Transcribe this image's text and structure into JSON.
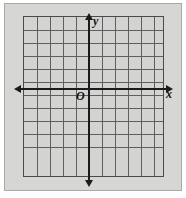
{
  "figure": {
    "kind": "coordinate-plane",
    "caption": "",
    "background_color": "#d6d6d4",
    "plate_color": "#d3d3d1",
    "grid_line_color": "#5f5f5f",
    "axis_color": "#1b1b1b",
    "frame_color": "#a8a8a6"
  },
  "labels": {
    "y_axis": "y",
    "x_axis": "x",
    "origin": "O"
  },
  "chart_data": {
    "type": "scatter",
    "title": "",
    "xlabel": "x",
    "ylabel": "y",
    "origin_label": "O",
    "grid": true,
    "legend": "none",
    "columns": 11,
    "rows": 11,
    "cell_size": 13,
    "xlim": [
      -6,
      5
    ],
    "ylim": [
      -6,
      5
    ],
    "x_tick_step": 1,
    "y_tick_step": 1,
    "tick_labels_shown": false,
    "x_axis_row_from_top": 5,
    "y_axis_col_from_left": 6,
    "arrows": [
      "left",
      "right",
      "up",
      "down"
    ],
    "series": [],
    "x": [],
    "values": [],
    "annotations": []
  }
}
